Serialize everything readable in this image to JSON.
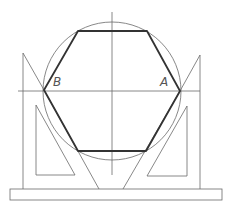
{
  "diagram": {
    "labels": {
      "vertex_left": "B",
      "vertex_right": "A"
    },
    "caption_left": "",
    "caption_right": "",
    "colors": {
      "construction_line": "#6a6a6a",
      "hexagon": "#333333",
      "background": "#ffffff"
    },
    "geometry": {
      "circle": {
        "cx": 112,
        "cy": 91,
        "r": 69
      },
      "hexagon_vertices": [
        [
          78,
          31
        ],
        [
          147,
          31
        ],
        [
          180,
          91
        ],
        [
          146,
          151
        ],
        [
          78,
          151
        ],
        [
          44,
          90
        ]
      ],
      "center_lines": {
        "horizontal_y": 91,
        "vertical_x": 112
      },
      "base_rect": {
        "x": 10,
        "y": 189,
        "w": 212,
        "h": 11
      }
    }
  }
}
